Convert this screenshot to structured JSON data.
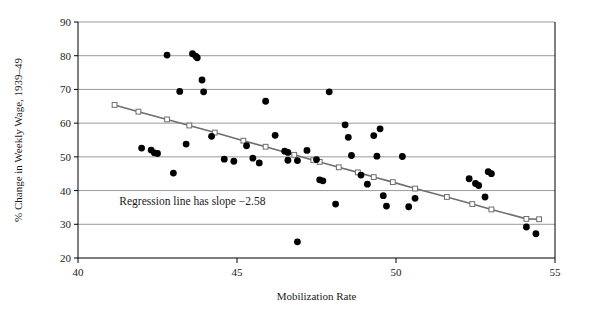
{
  "chart_data": {
    "type": "scatter",
    "title": "",
    "xlabel": "Mobilization Rate",
    "ylabel": "% Change in Weekly Wage, 1939–49",
    "xlim": [
      40,
      55
    ],
    "ylim": [
      20,
      90
    ],
    "xticks": [
      40,
      45,
      50,
      55
    ],
    "yticks": [
      20,
      30,
      40,
      50,
      60,
      70,
      80,
      90
    ],
    "xtick_labels": [
      "40",
      "45",
      "50",
      "55"
    ],
    "ytick_labels": [
      "20",
      "30",
      "40",
      "50",
      "60",
      "70",
      "80",
      "90"
    ],
    "grid": "horizontal",
    "legend": "none",
    "annotations": [
      {
        "text": "Regression line has slope −2.58",
        "x": 41.3,
        "y": 35.8
      }
    ],
    "series": [
      {
        "name": "States",
        "type": "scatter",
        "marker": "filled-circle",
        "color": "#000000",
        "points": [
          [
            42.0,
            52.6
          ],
          [
            42.3,
            52.0
          ],
          [
            42.4,
            51.2
          ],
          [
            42.5,
            51.0
          ],
          [
            42.8,
            80.2
          ],
          [
            43.0,
            45.2
          ],
          [
            43.2,
            69.4
          ],
          [
            43.4,
            53.8
          ],
          [
            43.6,
            80.6
          ],
          [
            43.7,
            79.9
          ],
          [
            43.75,
            79.4
          ],
          [
            43.9,
            72.8
          ],
          [
            43.95,
            69.3
          ],
          [
            44.2,
            56.1
          ],
          [
            44.6,
            49.3
          ],
          [
            44.9,
            48.7
          ],
          [
            45.3,
            53.3
          ],
          [
            45.5,
            49.6
          ],
          [
            45.7,
            48.2
          ],
          [
            45.9,
            66.5
          ],
          [
            46.2,
            56.4
          ],
          [
            46.5,
            51.7
          ],
          [
            46.6,
            51.3
          ],
          [
            46.6,
            49.0
          ],
          [
            46.9,
            48.9
          ],
          [
            46.9,
            24.8
          ],
          [
            47.2,
            51.9
          ],
          [
            47.5,
            49.2
          ],
          [
            47.6,
            43.2
          ],
          [
            47.7,
            42.9
          ],
          [
            47.9,
            69.3
          ],
          [
            48.1,
            36.0
          ],
          [
            48.4,
            59.5
          ],
          [
            48.5,
            55.8
          ],
          [
            48.6,
            50.4
          ],
          [
            48.9,
            44.6
          ],
          [
            49.1,
            41.9
          ],
          [
            49.3,
            56.3
          ],
          [
            49.4,
            50.2
          ],
          [
            49.5,
            58.3
          ],
          [
            49.6,
            38.5
          ],
          [
            49.7,
            35.4
          ],
          [
            50.2,
            50.1
          ],
          [
            50.4,
            35.2
          ],
          [
            50.6,
            37.7
          ],
          [
            52.3,
            43.5
          ],
          [
            52.5,
            42.1
          ],
          [
            52.6,
            41.5
          ],
          [
            52.8,
            38.1
          ],
          [
            52.9,
            45.6
          ],
          [
            53.0,
            45.0
          ],
          [
            54.1,
            29.2
          ],
          [
            54.4,
            27.2
          ]
        ]
      },
      {
        "name": "Regression line",
        "type": "line",
        "marker": "open-square",
        "color": "#6e6e6e",
        "slope": -2.58,
        "points": [
          [
            41.15,
            65.4
          ],
          [
            41.9,
            63.4
          ],
          [
            42.8,
            61.1
          ],
          [
            43.5,
            59.3
          ],
          [
            44.3,
            57.2
          ],
          [
            45.2,
            54.8
          ],
          [
            45.9,
            53.0
          ],
          [
            46.8,
            50.6
          ],
          [
            47.4,
            49.0
          ],
          [
            47.6,
            48.5
          ],
          [
            48.2,
            46.9
          ],
          [
            48.8,
            45.4
          ],
          [
            49.3,
            44.0
          ],
          [
            49.9,
            42.5
          ],
          [
            50.6,
            40.6
          ],
          [
            51.6,
            38.1
          ],
          [
            52.4,
            36.0
          ],
          [
            53.0,
            34.4
          ],
          [
            54.1,
            31.6
          ],
          [
            54.5,
            31.5
          ]
        ]
      }
    ]
  }
}
